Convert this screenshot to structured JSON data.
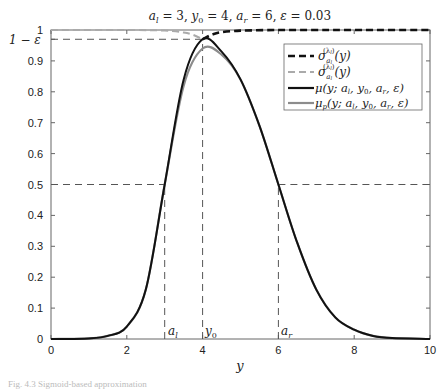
{
  "chart_data": {
    "type": "line",
    "xlabel": "y",
    "ylabel": "",
    "xlim": [
      0,
      10
    ],
    "ylim": [
      0,
      1
    ],
    "grid": false,
    "legend_position": "upper right",
    "parameters": {
      "a_l": 3,
      "y_0": 4,
      "a_r": 6,
      "epsilon": 0.03
    },
    "x_ticks": [
      0,
      2,
      4,
      6,
      8,
      10
    ],
    "y_ticks": [
      0,
      0.1,
      0.2,
      0.3,
      0.4,
      0.5,
      0.6,
      0.7,
      0.8,
      0.9,
      1
    ],
    "y_tick_labels": [
      "0",
      "0.1",
      "0.2",
      "0.3",
      "0.4",
      "0.5",
      "0.6",
      "0.7",
      "0.8",
      "0.9",
      "1"
    ],
    "extra_y_tick_label": "1 − ε",
    "extra_y_tick_value": 0.97,
    "reference_lines": [
      {
        "type": "horizontal",
        "y": 0.97,
        "x_from": 0,
        "x_to": 4,
        "style": "dashed"
      },
      {
        "type": "horizontal",
        "y": 0.5,
        "x_from": 0,
        "x_to": 3,
        "style": "dashed"
      },
      {
        "type": "horizontal",
        "y": 0.5,
        "x_from": 6,
        "x_to": 10,
        "style": "dashed"
      },
      {
        "type": "vertical",
        "x": 3,
        "y_from": 0,
        "y_to": 0.5,
        "style": "dashed",
        "label": "a_l"
      },
      {
        "type": "vertical",
        "x": 4,
        "y_from": 0,
        "y_to": 0.97,
        "style": "dashed",
        "label": "y_0"
      },
      {
        "type": "vertical",
        "x": 6,
        "y_from": 0,
        "y_to": 0.5,
        "style": "dashed",
        "label": "a_r"
      }
    ],
    "series": [
      {
        "name": "σ_{a_l}^{(λ_l)}(y) (right branch)",
        "style": "dashed",
        "color": "#111111",
        "width": 2.6,
        "x": [
          4,
          4.25,
          4.5,
          5,
          6,
          7,
          8,
          10
        ],
        "y": [
          0.97,
          0.985,
          0.993,
          0.998,
          1,
          1,
          1,
          1
        ]
      },
      {
        "name": "σ_{a_l}^{(λ_l)}(y) (left branch)",
        "style": "dashed",
        "color": "#aaaaaa",
        "width": 2,
        "x": [
          0,
          2,
          3,
          3.5,
          3.75,
          4
        ],
        "y": [
          1,
          1,
          0.998,
          0.992,
          0.984,
          0.97
        ]
      },
      {
        "name": "μ(y; a_l, y_0, a_r, ε)",
        "style": "solid",
        "color": "#111111",
        "width": 2,
        "x": [
          0,
          1,
          1.5,
          2,
          2.5,
          3,
          3.5,
          4,
          4.5,
          5,
          5.5,
          6,
          6.5,
          7,
          7.5,
          8,
          8.5,
          9,
          10
        ],
        "y": [
          0,
          0.002,
          0.01,
          0.04,
          0.16,
          0.5,
          0.84,
          0.97,
          0.93,
          0.84,
          0.69,
          0.5,
          0.31,
          0.16,
          0.07,
          0.03,
          0.01,
          0.003,
          0
        ]
      },
      {
        "name": "μ_p(y; a_l, y_0, a_r, ε)",
        "style": "solid",
        "color": "#8c8c8c",
        "width": 2.2,
        "x": [
          0,
          1,
          1.5,
          2,
          2.5,
          3,
          3.5,
          4,
          4.5,
          5,
          5.5,
          6,
          6.5,
          7,
          7.5,
          8,
          8.5,
          9,
          10
        ],
        "y": [
          0,
          0.002,
          0.01,
          0.04,
          0.16,
          0.5,
          0.82,
          0.94,
          0.92,
          0.84,
          0.69,
          0.5,
          0.31,
          0.16,
          0.07,
          0.03,
          0.01,
          0.003,
          0
        ]
      }
    ],
    "legend": [
      {
        "label": "σ_{a_l}^{(λ_l)}(y)",
        "style": "dashed",
        "color": "#111111"
      },
      {
        "label": "σ_{a_l}^{(λ_l)}(y)",
        "style": "dashed",
        "color": "#aaaaaa"
      },
      {
        "label": "μ(y; a_l, y_0, a_r, ε)",
        "style": "solid",
        "color": "#111111"
      },
      {
        "label": "μ_p(y; a_l, y_0, a_r, ε)",
        "style": "solid",
        "color": "#8c8c8c"
      }
    ]
  },
  "labels": {
    "title_parts": [
      "a",
      "l",
      " = 3, ",
      "y",
      "0",
      " = 4, ",
      "a",
      "r",
      " = 6, ",
      "ε",
      " = 0.03"
    ],
    "xlabel": "y",
    "one_minus_eps": "1 − ε",
    "vline_labels": {
      "al": [
        "a",
        "l"
      ],
      "y0": [
        "y",
        "0"
      ],
      "ar": [
        "a",
        "r"
      ]
    },
    "legend": [
      {
        "base": "σ",
        "sup": "(λ",
        "supsub": "l",
        "supend": ")",
        "sub": "a",
        "subsub": "l",
        "rest": "(y)"
      },
      {
        "base": "σ",
        "sup": "(λ",
        "supsub": "l",
        "supend": ")",
        "sub": "a",
        "subsub": "l",
        "rest": "(y)"
      },
      {
        "text": "μ(y; a",
        "t2": "l",
        "t3": ", y",
        "t4": "0",
        "t5": ", a",
        "t6": "r",
        "t7": ", ε)"
      },
      {
        "text": "μ",
        "sub": "p",
        "t1": "(y; a",
        "t2": "l",
        "t3": ", y",
        "t4": "0",
        "t5": ", a",
        "t6": "r",
        "t7": ", ε)"
      }
    ],
    "caption": "Fig. 4.3  Sigmoid-based approximation"
  }
}
